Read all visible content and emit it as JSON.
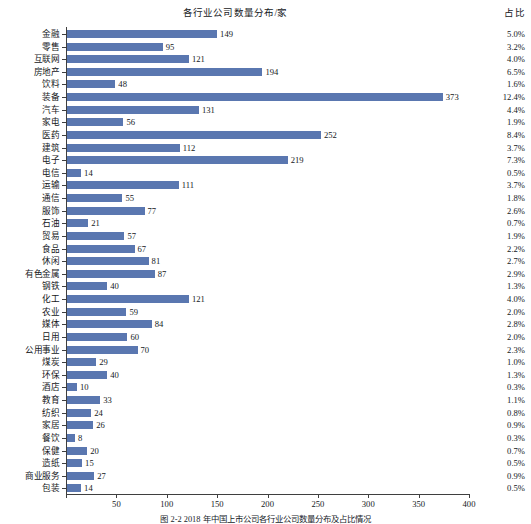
{
  "chart_data": {
    "type": "bar",
    "orientation": "horizontal",
    "title": "各行业公司数量分布/家",
    "xlabel": "",
    "ylabel": "",
    "xlim": [
      0,
      400
    ],
    "xticks": [
      0,
      50,
      100,
      150,
      200,
      250,
      300,
      350,
      400
    ],
    "grid": false,
    "legend": null,
    "bar_color": "#5a77b0",
    "categories": [
      "金融",
      "零售",
      "互联网",
      "房地产",
      "饮料",
      "装备",
      "汽车",
      "家电",
      "医药",
      "建筑",
      "电子",
      "电信",
      "运输",
      "通信",
      "服饰",
      "石油",
      "贸易",
      "食品",
      "休闲",
      "有色金属",
      "钢铁",
      "化工",
      "农业",
      "媒体",
      "日用",
      "公用事业",
      "煤炭",
      "环保",
      "酒店",
      "教育",
      "纺织",
      "家居",
      "餐饮",
      "保健",
      "造纸",
      "商业服务",
      "包装"
    ],
    "values": [
      149,
      95,
      121,
      194,
      48,
      373,
      131,
      56,
      252,
      112,
      219,
      14,
      111,
      55,
      77,
      21,
      57,
      67,
      81,
      87,
      40,
      121,
      59,
      84,
      60,
      70,
      29,
      40,
      10,
      33,
      24,
      26,
      8,
      20,
      15,
      27,
      14
    ],
    "percent_header": "占比",
    "percents": [
      "5.0%",
      "3.2%",
      "4.0%",
      "6.5%",
      "1.6%",
      "12.4%",
      "4.4%",
      "1.9%",
      "8.4%",
      "3.7%",
      "7.3%",
      "0.5%",
      "3.7%",
      "1.8%",
      "2.6%",
      "0.7%",
      "1.9%",
      "2.2%",
      "2.7%",
      "2.9%",
      "1.3%",
      "4.0%",
      "2.0%",
      "2.8%",
      "2.0%",
      "2.3%",
      "1.0%",
      "1.3%",
      "0.3%",
      "1.1%",
      "0.8%",
      "0.9%",
      "0.3%",
      "0.7%",
      "0.5%",
      "0.9%",
      "0.5%"
    ]
  },
  "figure": {
    "caption": "图 2-2  2018 年中国上市公司各行业公司数量分布及占比情况"
  }
}
